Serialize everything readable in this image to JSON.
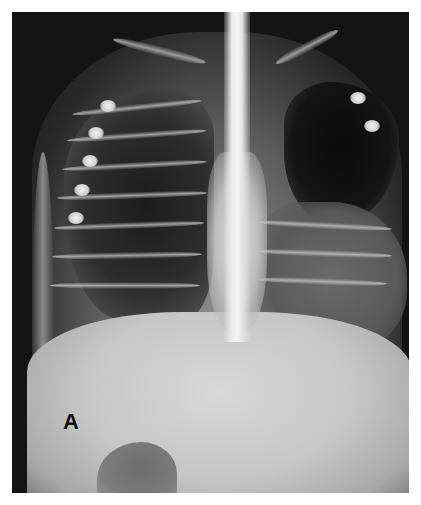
{
  "image": {
    "kind": "chest-radiograph",
    "view": "frontal",
    "label": "A",
    "colors": {
      "background": "#ffffff",
      "film_dark": "#141414",
      "bone_bright": "#ececec",
      "abdomen": "#c6c6c6"
    },
    "features": [
      "trachea-spine-midline",
      "right-lung-ribs",
      "left-upper-lung-hyperlucent",
      "left-lower-opacity",
      "clavicles",
      "stomach-gas-bubble",
      "abdomen-soft-tissue"
    ]
  }
}
